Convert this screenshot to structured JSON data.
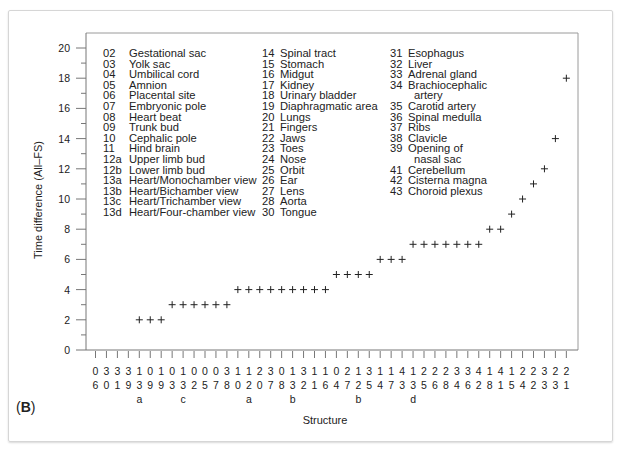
{
  "panel_label": {
    "open": "(",
    "letter": "B",
    "close": ")"
  },
  "chart_data": {
    "type": "scatter",
    "marker": "+",
    "title": "",
    "xlabel": "Structure",
    "ylabel": "Time difference (All–FS)",
    "ylim": [
      0,
      20
    ],
    "yticks": [
      0,
      2,
      4,
      6,
      8,
      10,
      12,
      14,
      16,
      18,
      20
    ],
    "grid": false,
    "categories": [
      "06",
      "30",
      "31",
      "39",
      "13a",
      "09",
      "19",
      "03",
      "13c",
      "02",
      "05",
      "07",
      "38",
      "10",
      "12a",
      "20",
      "37",
      "08",
      "13b",
      "32",
      "11",
      "16",
      "04",
      "27",
      "12b",
      "35",
      "14",
      "17",
      "43",
      "13d",
      "25",
      "26",
      "28",
      "34",
      "36",
      "42",
      "18",
      "41",
      "15",
      "24",
      "22",
      "33",
      "23",
      "21"
    ],
    "values": [
      null,
      null,
      null,
      null,
      2,
      2,
      2,
      3,
      3,
      3,
      3,
      3,
      3,
      4,
      4,
      4,
      4,
      4,
      4,
      4,
      4,
      4,
      5,
      5,
      5,
      5,
      6,
      6,
      6,
      7,
      7,
      7,
      7,
      7,
      7,
      7,
      8,
      8,
      9,
      10,
      11,
      12,
      14,
      18
    ],
    "legend_columns": [
      [
        {
          "code": "02",
          "name": "Gestational sac"
        },
        {
          "code": "03",
          "name": "Yolk sac"
        },
        {
          "code": "04",
          "name": "Umbilical cord"
        },
        {
          "code": "05",
          "name": "Amnion"
        },
        {
          "code": "06",
          "name": "Placental site"
        },
        {
          "code": "07",
          "name": "Embryonic pole"
        },
        {
          "code": "08",
          "name": "Heart beat"
        },
        {
          "code": "09",
          "name": "Trunk bud"
        },
        {
          "code": "10",
          "name": "Cephalic pole"
        },
        {
          "code": "11",
          "name": "Hind brain"
        },
        {
          "code": "12a",
          "name": "Upper limb bud"
        },
        {
          "code": "12b",
          "name": "Lower limb bud"
        },
        {
          "code": "13a",
          "name": "Heart/Monochamber view"
        },
        {
          "code": "13b",
          "name": "Heart/Bichamber view"
        },
        {
          "code": "13c",
          "name": "Heart/Trichamber view"
        },
        {
          "code": "13d",
          "name": "Heart/Four-chamber view"
        }
      ],
      [
        {
          "code": "14",
          "name": "Spinal tract"
        },
        {
          "code": "15",
          "name": "Stomach"
        },
        {
          "code": "16",
          "name": "Midgut"
        },
        {
          "code": "17",
          "name": "Kidney"
        },
        {
          "code": "18",
          "name": "Urinary bladder"
        },
        {
          "code": "19",
          "name": "Diaphragmatic area"
        },
        {
          "code": "20",
          "name": "Lungs"
        },
        {
          "code": "21",
          "name": "Fingers"
        },
        {
          "code": "22",
          "name": "Jaws"
        },
        {
          "code": "23",
          "name": "Toes"
        },
        {
          "code": "24",
          "name": "Nose"
        },
        {
          "code": "25",
          "name": "Orbit"
        },
        {
          "code": "26",
          "name": "Ear"
        },
        {
          "code": "27",
          "name": "Lens"
        },
        {
          "code": "28",
          "name": "Aorta"
        },
        {
          "code": "30",
          "name": "Tongue"
        }
      ],
      [
        {
          "code": "31",
          "name": "Esophagus"
        },
        {
          "code": "32",
          "name": "Liver"
        },
        {
          "code": "33",
          "name": "Adrenal gland"
        },
        {
          "code": "34",
          "name": "Brachiocephalic"
        },
        {
          "code": "",
          "name": "artery"
        },
        {
          "code": "35",
          "name": "Carotid artery"
        },
        {
          "code": "36",
          "name": "Spinal medulla"
        },
        {
          "code": "37",
          "name": "Ribs"
        },
        {
          "code": "38",
          "name": "Clavicle"
        },
        {
          "code": "39",
          "name": "Opening of"
        },
        {
          "code": "",
          "name": "nasal sac"
        },
        {
          "code": "41",
          "name": "Cerebellum"
        },
        {
          "code": "42",
          "name": "Cisterna magna"
        },
        {
          "code": "43",
          "name": "Choroid plexus"
        }
      ]
    ]
  }
}
